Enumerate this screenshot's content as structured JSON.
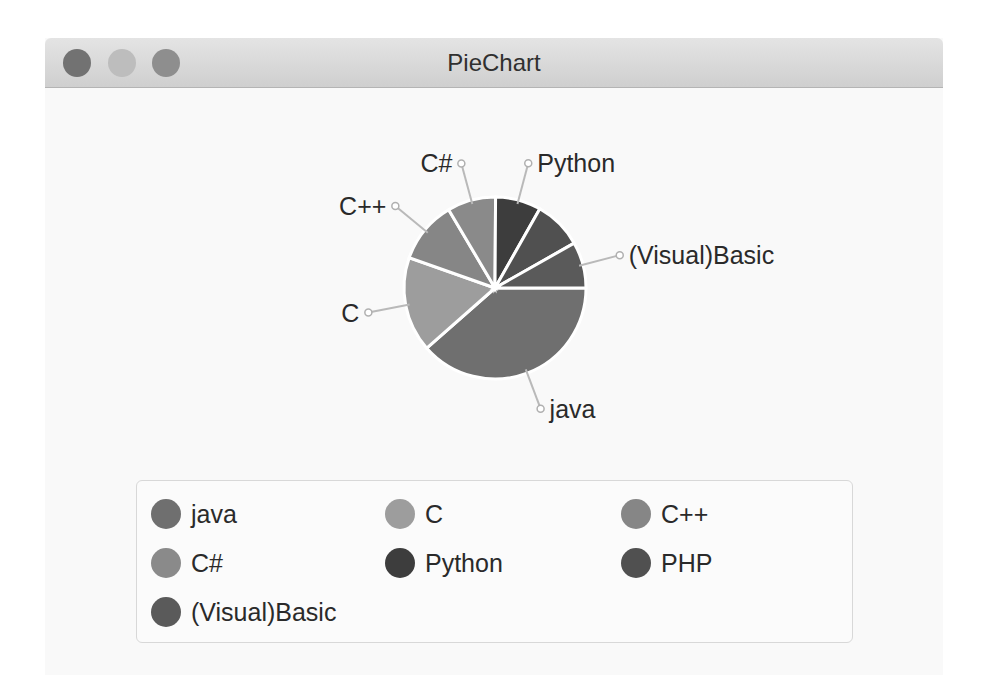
{
  "window": {
    "title": "PieChart",
    "buttons": [
      "close",
      "minimize",
      "maximize"
    ]
  },
  "chart_data": {
    "type": "pie",
    "title": "PieChart",
    "categories": [
      "java",
      "C",
      "C++",
      "C#",
      "Python",
      "PHP",
      "(Visual)Basic"
    ],
    "values": [
      38.5,
      16.9,
      11.1,
      8.6,
      8.1,
      8.6,
      8.2
    ],
    "colors": [
      "#6f6f6f",
      "#9d9d9d",
      "#868686",
      "#8a8a8a",
      "#3d3d3d",
      "#505050",
      "#5a5a5a"
    ],
    "slice_labels_visible": [
      true,
      true,
      true,
      true,
      true,
      false,
      true
    ],
    "start_angle_deg": 0,
    "direction": "clockwise from 3 o'clock",
    "legend_position": "bottom",
    "legend_columns": 3
  },
  "legend": {
    "items": [
      {
        "label": "java",
        "color": "#6f6f6f"
      },
      {
        "label": "C",
        "color": "#9d9d9d"
      },
      {
        "label": "C++",
        "color": "#868686"
      },
      {
        "label": "C#",
        "color": "#8a8a8a"
      },
      {
        "label": "Python",
        "color": "#3d3d3d"
      },
      {
        "label": "PHP",
        "color": "#505050"
      },
      {
        "label": "(Visual)Basic",
        "color": "#5a5a5a"
      }
    ]
  }
}
